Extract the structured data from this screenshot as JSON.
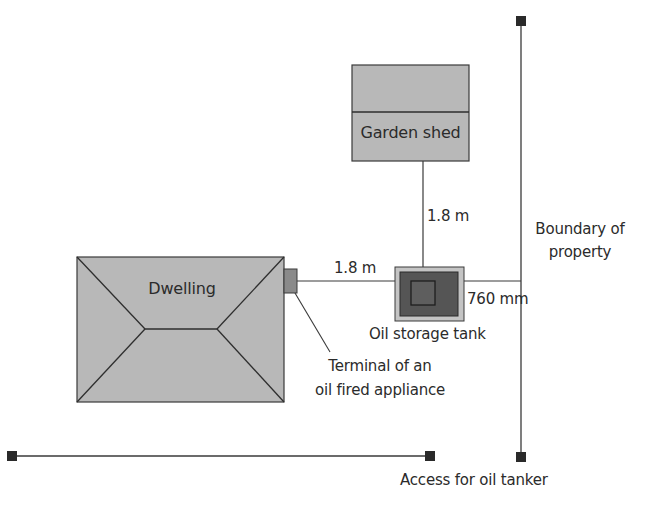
{
  "diagram": {
    "colors": {
      "building_fill": "#b8b8b8",
      "outline": "#3a3a3a",
      "tank_outer": "#c4c4c4",
      "tank_body": "#555555",
      "terminal": "#8a8a8a",
      "marker": "#2a2a2a",
      "line": "#3a3a3a"
    },
    "elements": {
      "dwelling": {
        "label": "Dwelling"
      },
      "garden_shed": {
        "label": "Garden shed"
      },
      "oil_tank": {
        "label": "Oil storage tank"
      },
      "terminal": {
        "label_line1": "Terminal of an",
        "label_line2": "oil fired appliance"
      },
      "boundary": {
        "label_line1": "Boundary of",
        "label_line2": "property"
      },
      "access": {
        "label": "Access for oil tanker"
      }
    },
    "dimensions": {
      "tank_to_shed": "1.8 m",
      "tank_to_terminal": "1.8 m",
      "tank_to_boundary": "760 mm"
    }
  }
}
